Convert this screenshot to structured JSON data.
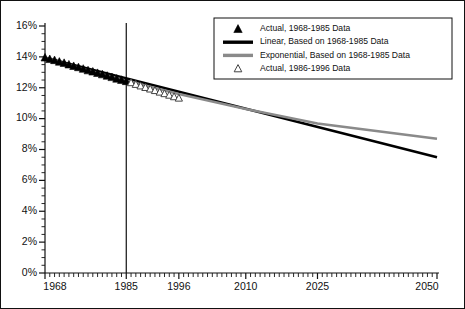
{
  "chart_data": {
    "type": "line",
    "title": "",
    "subtitle": "",
    "xlabel": "",
    "ylabel": "",
    "xlim": [
      1968,
      2050
    ],
    "ylim": [
      0,
      16
    ],
    "grid": false,
    "legend_position": "top-right",
    "y_ticks": [
      "0%",
      "2%",
      "4%",
      "6%",
      "8%",
      "10%",
      "12%",
      "14%",
      "16%"
    ],
    "y_tick_values": [
      0,
      2,
      4,
      6,
      8,
      10,
      12,
      14,
      16
    ],
    "y_minor_step": 0.5,
    "x_ticks": [
      "1968",
      "1985",
      "1996",
      "2010",
      "2025",
      "2050"
    ],
    "x_tick_values": [
      1968,
      1985,
      1996,
      2010,
      2025,
      2050
    ],
    "x_minor_step": 1,
    "reference_line": {
      "name": "divider-1985",
      "x": 1985,
      "color": "#111111"
    },
    "series": [
      {
        "name": "Actual, 1968-1985 Data",
        "type": "scatter",
        "marker": "filled-triangle",
        "color": "#000000",
        "x": [
          1968,
          1969,
          1970,
          1971,
          1972,
          1973,
          1974,
          1975,
          1976,
          1977,
          1978,
          1979,
          1980,
          1981,
          1982,
          1983,
          1984,
          1985
        ],
        "values": [
          13.95,
          13.85,
          13.78,
          13.68,
          13.6,
          13.5,
          13.4,
          13.32,
          13.22,
          13.12,
          13.04,
          12.95,
          12.86,
          12.77,
          12.68,
          12.58,
          12.5,
          12.42
        ]
      },
      {
        "name": "Actual, 1986-1996 Data",
        "type": "scatter",
        "marker": "open-triangle",
        "color": "#444444",
        "x": [
          1986,
          1987,
          1988,
          1989,
          1990,
          1991,
          1992,
          1993,
          1994,
          1995,
          1996
        ],
        "values": [
          12.33,
          12.22,
          12.12,
          12.02,
          11.92,
          11.82,
          11.72,
          11.62,
          11.52,
          11.42,
          11.33
        ]
      },
      {
        "name": "Linear, Based on 1968-1985 Data",
        "type": "line",
        "color": "#000000",
        "width": 2.6,
        "x": [
          1968,
          2050
        ],
        "values": [
          13.95,
          7.5
        ]
      },
      {
        "name": "Exponential, Based on 1968-1985 Data",
        "type": "line",
        "color": "#8a8a8a",
        "width": 2.6,
        "x": [
          1968,
          1975,
          1985,
          1996,
          2010,
          2025,
          2050
        ],
        "values": [
          13.95,
          13.3,
          12.45,
          11.6,
          10.62,
          9.68,
          8.7
        ]
      }
    ],
    "legend_entries": [
      {
        "label": "Actual, 1968-1985 Data",
        "marker": "filled-triangle",
        "color": "#000000"
      },
      {
        "label": "Linear, Based on 1968-1985 Data",
        "marker": "line",
        "color": "#000000"
      },
      {
        "label": "Exponential, Based on 1968-1985 Data",
        "marker": "line",
        "color": "#8a8a8a"
      },
      {
        "label": "Actual, 1986-1996 Data",
        "marker": "open-triangle",
        "color": "#444444"
      }
    ]
  }
}
